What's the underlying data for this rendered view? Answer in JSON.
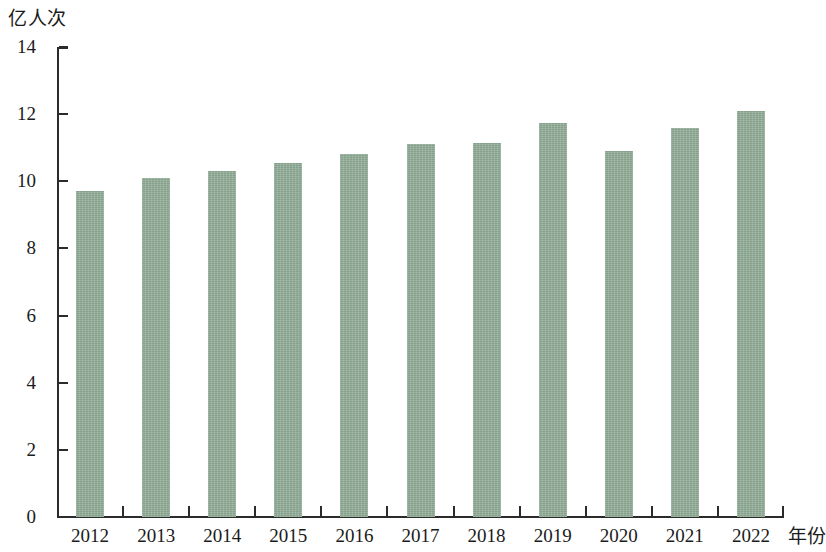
{
  "chart_data": {
    "type": "bar",
    "title": "",
    "subtitle": "",
    "xlabel": "年份",
    "ylabel": "亿人次",
    "categories": [
      "2012",
      "2013",
      "2014",
      "2015",
      "2016",
      "2017",
      "2018",
      "2019",
      "2020",
      "2021",
      "2022"
    ],
    "values": [
      9.7,
      10.1,
      10.3,
      10.55,
      10.8,
      11.1,
      11.15,
      11.75,
      10.9,
      11.6,
      12.1
    ],
    "ylim": [
      0,
      14
    ],
    "ytick_labels": [
      "0",
      "2",
      "4",
      "6",
      "8",
      "10",
      "12",
      "14"
    ],
    "ytick_values": [
      0,
      2,
      4,
      6,
      8,
      10,
      12,
      14
    ],
    "grid": false,
    "legend": false,
    "legend_position": "none",
    "series": [
      {
        "name": "亿人次",
        "color": "#8fab96",
        "values": [
          9.7,
          10.1,
          10.3,
          10.55,
          10.8,
          11.1,
          11.15,
          11.75,
          10.9,
          11.6,
          12.1
        ]
      }
    ],
    "bar_color": "#8fab96",
    "axis_color": "#2b2b2b",
    "background_color": "#ffffff"
  }
}
